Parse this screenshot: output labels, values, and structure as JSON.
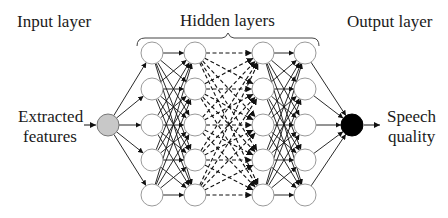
{
  "diagram": {
    "labels": {
      "input_layer": "Input layer",
      "hidden_layers": "Hidden layers",
      "output_layer": "Output layer",
      "input_line1": "Extracted",
      "input_line2": "features",
      "output_line1": "Speech",
      "output_line2": "quality"
    },
    "colors": {
      "input_node_fill": "#c8c8c8",
      "output_node_fill": "#000000",
      "hidden_node_stroke": "#9a9a9a",
      "edge": "#111111"
    },
    "structure": {
      "input_nodes": 1,
      "hidden_layers": 4,
      "nodes_per_hidden_layer": 5,
      "output_nodes": 1,
      "dashed_between_hidden": [
        2,
        3
      ]
    }
  }
}
